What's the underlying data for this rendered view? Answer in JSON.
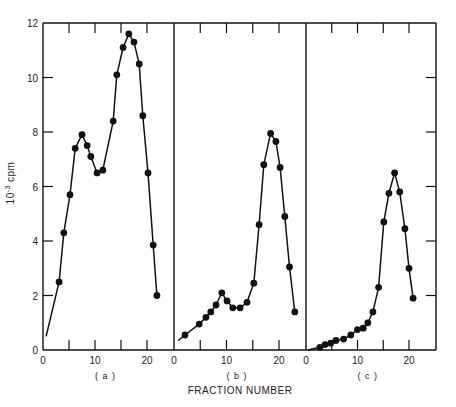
{
  "chart_data": {
    "type": "line",
    "title": "",
    "xlabel": "FRACTION NUMBER",
    "ylabel": "10^-3 cpm",
    "ylabel_display": {
      "base": "10",
      "exp": "-3",
      "unit": "cpm"
    },
    "ylim": [
      0,
      12
    ],
    "y_ticks": [
      0,
      2,
      4,
      6,
      8,
      10,
      12
    ],
    "grid": false,
    "legend": null,
    "panels": [
      {
        "label": "(a)",
        "xlim": [
          0,
          25
        ],
        "x_ticks": [
          0,
          10,
          20
        ],
        "line_start": {
          "x": 0.6,
          "y": 0.5
        },
        "x": [
          3.1,
          4.0,
          5.2,
          6.2,
          7.5,
          8.5,
          9.2,
          10.4,
          11.5,
          13.5,
          14.2,
          15.4,
          16.5,
          17.5,
          18.5,
          19.2,
          20.2,
          21.2,
          21.9
        ],
        "y": [
          2.5,
          4.3,
          5.7,
          7.4,
          7.9,
          7.5,
          7.1,
          6.5,
          6.6,
          8.4,
          10.1,
          11.1,
          11.6,
          11.3,
          10.5,
          8.6,
          6.5,
          3.85,
          2.0
        ]
      },
      {
        "label": "(b)",
        "xlim": [
          0,
          25
        ],
        "x_ticks": [
          0,
          10,
          20
        ],
        "line_start": {
          "x": 0.8,
          "y": 0.35
        },
        "x": [
          2.1,
          4.8,
          6.1,
          7.0,
          8.0,
          9.1,
          10.1,
          11.2,
          12.6,
          13.9,
          15.2,
          16.2,
          17.1,
          18.4,
          19.4,
          20.2,
          21.1,
          22.0,
          23.0
        ],
        "y": [
          0.55,
          0.95,
          1.2,
          1.4,
          1.65,
          2.1,
          1.8,
          1.55,
          1.55,
          1.75,
          2.45,
          4.6,
          6.8,
          7.95,
          7.65,
          6.7,
          4.9,
          3.05,
          1.4
        ]
      },
      {
        "label": "(c)",
        "xlim": [
          0,
          25
        ],
        "x_ticks": [
          0,
          10,
          20
        ],
        "line_start": {
          "x": 0.4,
          "y": 0.0
        },
        "x": [
          2.7,
          3.7,
          4.8,
          5.8,
          7.3,
          8.7,
          10.0,
          11.1,
          12.0,
          13.0,
          14.1,
          15.1,
          16.1,
          17.2,
          18.2,
          19.2,
          20.0,
          20.8
        ],
        "y": [
          0.1,
          0.2,
          0.25,
          0.35,
          0.4,
          0.55,
          0.75,
          0.8,
          1.0,
          1.4,
          2.3,
          4.7,
          5.75,
          6.5,
          5.8,
          4.45,
          3.0,
          1.9
        ]
      }
    ]
  }
}
